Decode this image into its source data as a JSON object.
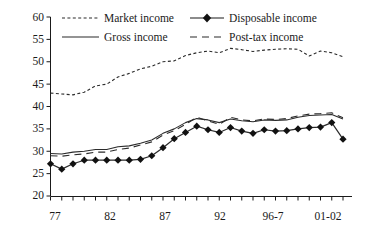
{
  "chart_data": {
    "type": "line",
    "title": "",
    "xlabel": "",
    "ylabel": "Gini coefficient (%)",
    "ylim": [
      20,
      60
    ],
    "ytick_labels": [
      "20",
      "25",
      "30",
      "35",
      "40",
      "45",
      "50",
      "55",
      "60"
    ],
    "ytick_values": [
      20,
      25,
      30,
      35,
      40,
      45,
      50,
      55,
      60
    ],
    "xtick_labels": [
      "77",
      "82",
      "87",
      "92",
      "96-7",
      "01-02"
    ],
    "xtick_values": [
      1977,
      1982,
      1987,
      1992,
      1996,
      2001
    ],
    "grid": false,
    "legend_position": "top-inside",
    "x": [
      1977,
      1978,
      1979,
      1980,
      1981,
      1982,
      1983,
      1984,
      1985,
      1986,
      1987,
      1988,
      1989,
      1990,
      1991,
      1992,
      1993,
      1994,
      1995,
      1996,
      1997,
      1998,
      1999,
      2000,
      2001,
      2002,
      2003
    ],
    "series": [
      {
        "name": "Market income",
        "style": "dotted",
        "marker": "none",
        "values": [
          43.0,
          42.8,
          42.6,
          43.2,
          44.6,
          45.0,
          46.6,
          47.4,
          48.4,
          49.0,
          50.0,
          50.2,
          51.4,
          52.0,
          52.4,
          52.0,
          53.0,
          52.7,
          52.3,
          52.6,
          52.8,
          52.9,
          52.8,
          51.3,
          52.4,
          52.0,
          51.1
        ]
      },
      {
        "name": "Gross income",
        "style": "solid",
        "marker": "none",
        "values": [
          29.5,
          29.4,
          29.8,
          30.0,
          30.4,
          30.4,
          31.0,
          31.2,
          31.8,
          32.5,
          34.0,
          35.0,
          36.4,
          37.3,
          37.0,
          36.4,
          37.2,
          36.8,
          36.6,
          37.0,
          36.9,
          37.0,
          37.6,
          38.0,
          38.1,
          38.2,
          37.2
        ]
      },
      {
        "name": "Post-tax income",
        "style": "dashed",
        "marker": "none",
        "values": [
          29.0,
          28.9,
          29.2,
          29.4,
          29.8,
          29.8,
          30.4,
          30.7,
          31.4,
          32.1,
          33.6,
          34.6,
          36.0,
          37.6,
          36.8,
          36.0,
          37.6,
          37.0,
          36.8,
          37.2,
          37.1,
          37.3,
          37.9,
          38.3,
          38.4,
          38.6,
          37.5
        ]
      },
      {
        "name": "Disposable income",
        "style": "solid",
        "marker": "diamond",
        "values": [
          27.2,
          26.0,
          27.2,
          28.0,
          28.0,
          28.0,
          28.0,
          28.0,
          28.2,
          29.0,
          30.8,
          32.8,
          34.2,
          35.6,
          34.8,
          34.2,
          35.3,
          34.5,
          34.0,
          34.8,
          34.5,
          34.6,
          35.0,
          35.3,
          35.4,
          36.4,
          32.7
        ]
      }
    ]
  },
  "legend": {
    "entries": [
      {
        "label": "Market income",
        "style": "dotted",
        "marker": "none"
      },
      {
        "label": "Disposable income",
        "style": "solid",
        "marker": "diamond"
      },
      {
        "label": "Gross income",
        "style": "solid",
        "marker": "none"
      },
      {
        "label": "Post-tax income",
        "style": "dashed",
        "marker": "none"
      }
    ]
  },
  "colors": {
    "ink": "#1a1a1a",
    "line": "#2b2b2b",
    "background": "#ffffff"
  }
}
